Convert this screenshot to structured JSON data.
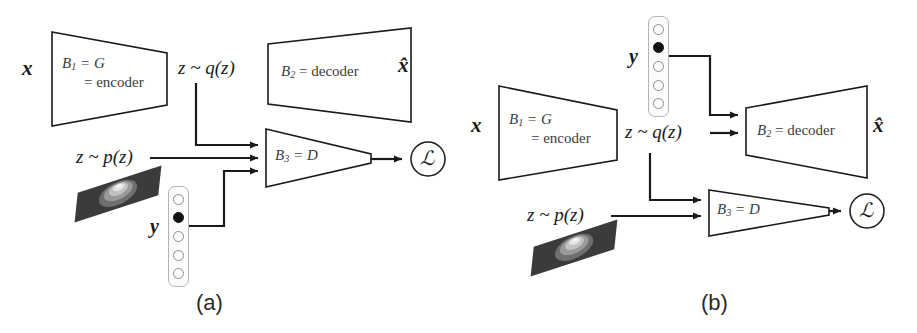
{
  "figure": {
    "type": "diagram",
    "background_color": "#ffffff",
    "stroke_color": "#1a1a1a",
    "text_color": "#3c3c3c"
  },
  "panels": [
    {
      "id": "a",
      "caption": "(a)",
      "input_label": "x",
      "output_label": "x̂",
      "blocks": [
        {
          "name": "encoder",
          "line1_prefix": "B",
          "line1_sub": "1",
          "line1_rest": " = G",
          "line2": "= encoder"
        },
        {
          "name": "decoder",
          "line1_prefix": "B",
          "line1_sub": "2",
          "line1_rest": " = decoder",
          "line2": ""
        },
        {
          "name": "discriminator",
          "line1_prefix": "B",
          "line1_sub": "3",
          "line1_rest": " = D",
          "line2": ""
        }
      ],
      "edge_labels": {
        "latent_posterior": "z ~ q(z)",
        "latent_prior": "z ~ p(z)",
        "condition": "y"
      },
      "loss_symbol": "ℒ",
      "onehot": {
        "cells": 5,
        "active_index": 1
      },
      "discriminator_inputs": 3
    },
    {
      "id": "b",
      "caption": "(b)",
      "input_label": "x",
      "output_label": "x̂",
      "blocks": [
        {
          "name": "encoder",
          "line1_prefix": "B",
          "line1_sub": "1",
          "line1_rest": " = G",
          "line2": "= encoder"
        },
        {
          "name": "decoder",
          "line1_prefix": "B",
          "line1_sub": "2",
          "line1_rest": " = decoder",
          "line2": ""
        },
        {
          "name": "discriminator",
          "line1_prefix": "B",
          "line1_sub": "3",
          "line1_rest": " = D",
          "line2": ""
        }
      ],
      "edge_labels": {
        "latent_posterior": "z ~ q(z)",
        "latent_prior": "z ~ p(z)",
        "condition": "y"
      },
      "loss_symbol": "ℒ",
      "onehot": {
        "cells": 5,
        "active_index": 1
      },
      "discriminator_inputs": 2
    }
  ]
}
